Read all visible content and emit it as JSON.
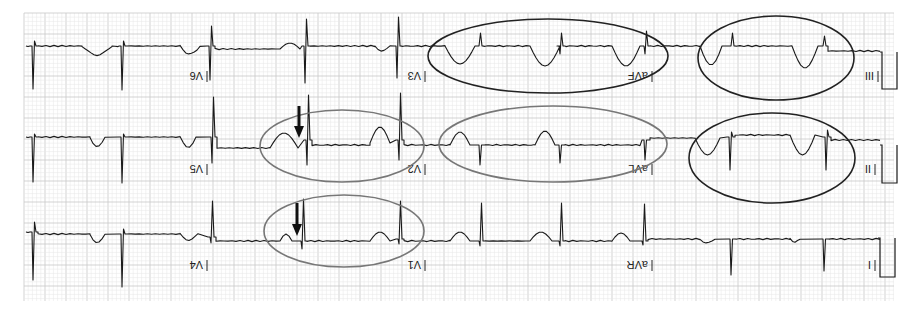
{
  "figure": {
    "width": 922,
    "height": 313,
    "orientation": "rotated-180",
    "paper": {
      "x": 24,
      "y": 13,
      "width": 870,
      "height": 288,
      "background": "#ffffff",
      "minor_grid_color": "#e6e6e6",
      "major_grid_color": "#c8c8c8",
      "minor_step": 4.2,
      "major_step": 21
    },
    "trace_color": "#1a1a1a",
    "rows": [
      {
        "row": 1,
        "baseline_y": 46,
        "leads": [
          {
            "label": "V6",
            "label_x": 205,
            "label_y": 74
          },
          {
            "label": "V3",
            "label_x": 423,
            "label_y": 74
          },
          {
            "label": "aVF",
            "label_x": 650,
            "label_y": 74
          },
          {
            "label": "III",
            "label_x": 876,
            "label_y": 74
          }
        ]
      },
      {
        "row": 2,
        "baseline_y": 140,
        "leads": [
          {
            "label": "V5",
            "label_x": 205,
            "label_y": 167
          },
          {
            "label": "V2",
            "label_x": 423,
            "label_y": 167
          },
          {
            "label": "aVL",
            "label_x": 650,
            "label_y": 167
          },
          {
            "label": "II",
            "label_x": 873,
            "label_y": 167
          }
        ]
      },
      {
        "row": 3,
        "baseline_y": 237,
        "leads": [
          {
            "label": "V4",
            "label_x": 205,
            "label_y": 263
          },
          {
            "label": "V1",
            "label_x": 423,
            "label_y": 263
          },
          {
            "label": "aVR",
            "label_x": 650,
            "label_y": 263
          },
          {
            "label": "I",
            "label_x": 873,
            "label_y": 263
          }
        ]
      }
    ],
    "annotations": {
      "ellipses": [
        {
          "id": "avf-region",
          "cx": 548,
          "cy": 56,
          "rx": 120,
          "ry": 37,
          "color": "#222222"
        },
        {
          "id": "iii-region",
          "cx": 776,
          "cy": 58,
          "rx": 78,
          "ry": 42,
          "color": "#222222"
        },
        {
          "id": "v5-v2-region",
          "cx": 342,
          "cy": 146,
          "rx": 82,
          "ry": 36,
          "color": "#777777"
        },
        {
          "id": "avl-region",
          "cx": 553,
          "cy": 144,
          "rx": 114,
          "ry": 38,
          "color": "#777777"
        },
        {
          "id": "ii-region",
          "cx": 772,
          "cy": 158,
          "rx": 83,
          "ry": 45,
          "color": "#222222"
        },
        {
          "id": "v4-v1-region",
          "cx": 344,
          "cy": 231,
          "rx": 80,
          "ry": 36,
          "color": "#777777"
        }
      ],
      "arrows": [
        {
          "id": "arrow-v5",
          "x": 299,
          "y1": 106,
          "y2": 138,
          "color": "#111111"
        },
        {
          "id": "arrow-v4",
          "x": 297,
          "y1": 203,
          "y2": 236,
          "color": "#111111"
        }
      ]
    },
    "calibration_pulses": [
      {
        "row": 1,
        "x1": 882,
        "x2": 897,
        "top": 52,
        "bottom": 89
      },
      {
        "row": 2,
        "x1": 882,
        "x2": 897,
        "top": 145,
        "bottom": 183
      },
      {
        "row": 3,
        "x1": 880,
        "x2": 895,
        "top": 238,
        "bottom": 277
      }
    ]
  }
}
